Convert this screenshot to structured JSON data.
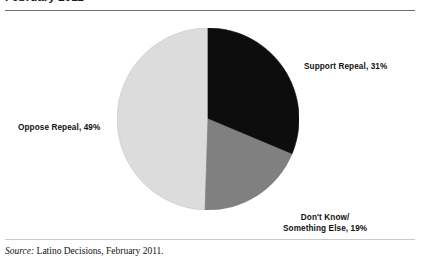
{
  "title": "February 2011",
  "source": {
    "prefix": "Source:",
    "text": "Latino Decisions, February 2011."
  },
  "labels": {
    "support": "Support Repeal, 31%",
    "oppose": "Oppose Repeal, 49%",
    "dont_know_line1": "Don't Know/",
    "dont_know_line2": "Something Else, 19%"
  },
  "colors": {
    "support": "#0d0d0d",
    "dont_know": "#808080",
    "oppose": "#dcdcdc",
    "edge": "#b5b5b5",
    "rule": "#6e6e6e",
    "text": "#111111"
  },
  "chart_data": {
    "type": "pie",
    "title": "February 2011",
    "categories": [
      "Support Repeal",
      "Don't Know/Something Else",
      "Oppose Repeal"
    ],
    "values": [
      31,
      19,
      49
    ],
    "value_unit": "%",
    "slice_colors": [
      "#0d0d0d",
      "#808080",
      "#dcdcdc"
    ],
    "data_labels": [
      "Support Repeal, 31%",
      "Don't Know/Something Else, 19%",
      "Oppose Repeal, 49%"
    ],
    "start_angle_deg": 0,
    "direction": "clockwise",
    "legend": "none",
    "labels_position": "outside",
    "grid": false
  }
}
